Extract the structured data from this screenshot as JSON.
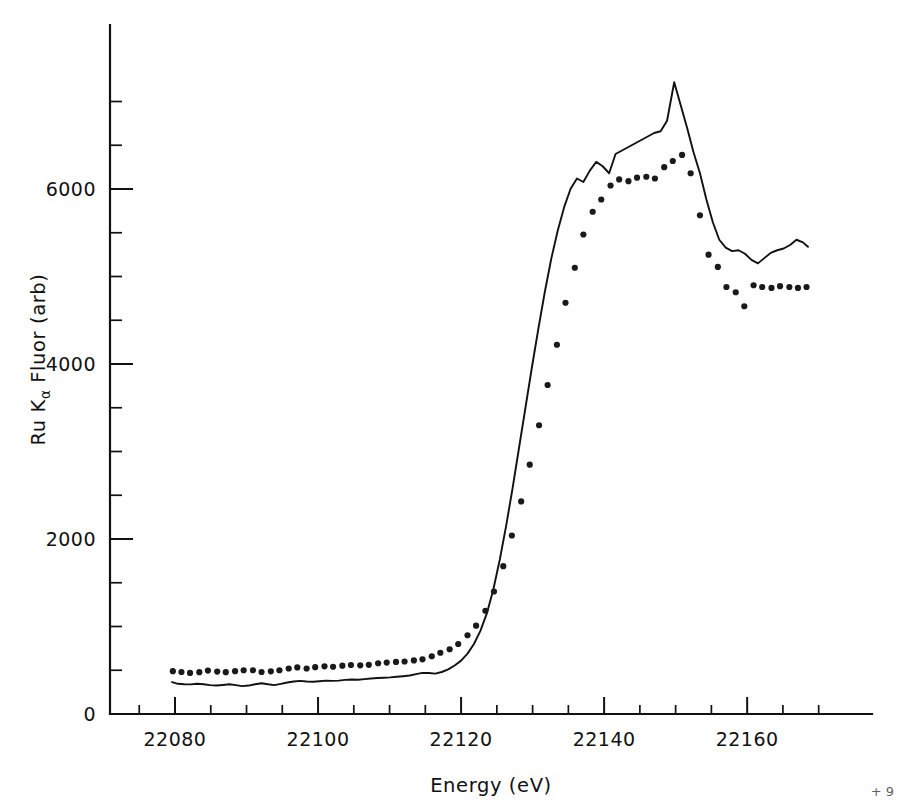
{
  "figure": {
    "background_color": "#ffffff",
    "ink_color": "#111111"
  },
  "axes": {
    "x_title": "Energy (eV)",
    "y_title_main": "Ru K",
    "y_title_sub": "α",
    "y_title_rest": " Fluor (arb)",
    "y_title_full": "Ru Kα Fluor (arb)",
    "x_tick_labels": [
      "22080",
      "22100",
      "22120",
      "22140",
      "22160"
    ],
    "y_tick_labels": [
      "0",
      "2000",
      "4000",
      "6000"
    ]
  },
  "chart_data": {
    "type": "line",
    "title": "",
    "xlabel": "Energy (eV)",
    "ylabel": "Ru Kα Fluor (arb)",
    "xlim": [
      22072,
      22170
    ],
    "ylim": [
      0,
      7700
    ],
    "x_major_ticks": [
      22080,
      22100,
      22120,
      22140,
      22160
    ],
    "x_minor_tick_step": 5,
    "y_major_ticks": [
      0,
      2000,
      4000,
      6000
    ],
    "y_minor_tick_step": 500,
    "grid": false,
    "legend": false,
    "legend_position": "none",
    "series": [
      {
        "name": "solid-curve",
        "style": "solid-line",
        "marker": "none",
        "color": "#111111",
        "x": [
          22079.6,
          22080.4,
          22081.3,
          22082.2,
          22083.1,
          22084.0,
          22084.9,
          22085.8,
          22086.7,
          22087.6,
          22088.5,
          22089.4,
          22090.3,
          22091.2,
          22092.1,
          22093.0,
          22093.9,
          22094.8,
          22095.7,
          22096.6,
          22097.5,
          22098.4,
          22099.3,
          22100.2,
          22101.1,
          22102.0,
          22102.9,
          22103.8,
          22104.7,
          22105.6,
          22106.5,
          22107.4,
          22108.3,
          22109.2,
          22110.1,
          22111.0,
          22111.9,
          22112.8,
          22113.7,
          22114.6,
          22115.5,
          22116.4,
          22117.3,
          22118.2,
          22119.1,
          22120.0,
          22120.9,
          22121.8,
          22122.7,
          22123.6,
          22124.5,
          22125.4,
          22126.3,
          22127.2,
          22128.1,
          22129.0,
          22129.9,
          22130.8,
          22131.7,
          22132.6,
          22133.5,
          22134.4,
          22135.3,
          22136.2,
          22137.1,
          22138.0,
          22138.9,
          22139.8,
          22140.7,
          22141.6,
          22142.5,
          22143.4,
          22144.3,
          22145.2,
          22146.1,
          22147.0,
          22147.9,
          22148.8,
          22149.8,
          22150.7,
          22151.6,
          22152.5,
          22153.4,
          22154.3,
          22155.2,
          22156.1,
          22157.0,
          22157.9,
          22158.8,
          22159.7,
          22160.6,
          22161.5,
          22162.4,
          22163.3,
          22164.2,
          22165.1,
          22166.0,
          22166.9,
          22167.8,
          22168.5
        ],
        "y": [
          365,
          345,
          340,
          338,
          345,
          340,
          330,
          325,
          332,
          340,
          330,
          318,
          325,
          340,
          352,
          340,
          330,
          345,
          360,
          372,
          378,
          372,
          368,
          375,
          382,
          378,
          382,
          390,
          395,
          392,
          398,
          405,
          412,
          415,
          418,
          425,
          432,
          440,
          455,
          470,
          468,
          462,
          480,
          510,
          555,
          610,
          690,
          800,
          950,
          1150,
          1420,
          1760,
          2150,
          2580,
          3040,
          3500,
          3960,
          4400,
          4820,
          5200,
          5520,
          5790,
          6000,
          6120,
          6080,
          6210,
          6310,
          6260,
          6180,
          6400,
          6440,
          6480,
          6520,
          6560,
          6600,
          6640,
          6660,
          6780,
          7220,
          6960,
          6700,
          6420,
          6180,
          5880,
          5620,
          5420,
          5330,
          5290,
          5300,
          5260,
          5190,
          5150,
          5210,
          5270,
          5300,
          5320,
          5360,
          5420,
          5390,
          5340
        ]
      },
      {
        "name": "dotted-series",
        "style": "dots",
        "marker": "point",
        "color": "#1a1a1a",
        "x": [
          22079.7,
          22080.9,
          22082.1,
          22083.4,
          22084.6,
          22085.9,
          22087.1,
          22088.4,
          22089.6,
          22090.9,
          22092.1,
          22093.4,
          22094.6,
          22095.9,
          22097.1,
          22098.4,
          22099.6,
          22100.9,
          22102.1,
          22103.4,
          22104.6,
          22105.9,
          22107.1,
          22108.4,
          22109.6,
          22110.9,
          22112.1,
          22113.4,
          22114.6,
          22115.9,
          22117.1,
          22118.4,
          22119.6,
          22120.9,
          22122.1,
          22123.4,
          22124.6,
          22125.9,
          22127.1,
          22128.4,
          22129.6,
          22130.9,
          22132.1,
          22133.4,
          22134.6,
          22135.9,
          22137.1,
          22138.4,
          22139.6,
          22140.9,
          22142.1,
          22143.4,
          22144.6,
          22145.9,
          22147.1,
          22148.4,
          22149.6,
          22150.9,
          22152.1,
          22153.4,
          22154.6,
          22155.9,
          22157.1,
          22158.4,
          22159.6,
          22160.9,
          22162.1,
          22163.4,
          22164.6,
          22165.9,
          22167.1,
          22168.3
        ],
        "y": [
          490,
          480,
          470,
          478,
          496,
          485,
          478,
          490,
          500,
          500,
          480,
          488,
          500,
          520,
          532,
          520,
          535,
          545,
          540,
          552,
          560,
          556,
          562,
          580,
          588,
          595,
          600,
          612,
          625,
          660,
          700,
          740,
          800,
          900,
          1010,
          1180,
          1400,
          1690,
          2040,
          2430,
          2850,
          3300,
          3760,
          4220,
          4700,
          5100,
          5480,
          5740,
          5880,
          6040,
          6110,
          6090,
          6130,
          6140,
          6120,
          6250,
          6320,
          6390,
          6180,
          5700,
          5250,
          5110,
          4880,
          4820,
          4660,
          4900,
          4880,
          4870,
          4890,
          4880,
          4870,
          4880
        ]
      }
    ]
  },
  "annotations": {
    "corner_mark": "+ 9"
  }
}
